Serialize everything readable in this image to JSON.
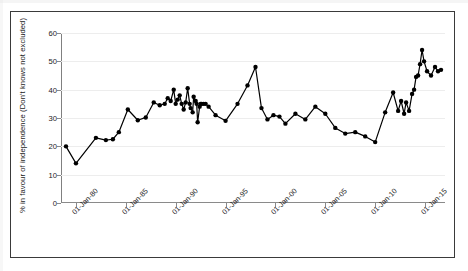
{
  "figure": {
    "background": "#ffffff",
    "frame_color": "#3a3a3a",
    "series_color": "#000000",
    "grid_color": "#ededed"
  },
  "axes": {
    "ylabel": "% in favour of independence (Don't knows not excluded)",
    "xlabel": "",
    "y_ticks": [
      "0",
      "10",
      "20",
      "30",
      "40",
      "50",
      "60"
    ],
    "x_ticks": [
      "01-Jan-80",
      "01-Jan-85",
      "01-Jan-90",
      "01-Jan-95",
      "01-Jan-00",
      "01-Jan-05",
      "01-Jan-10",
      "01-Jan-15"
    ]
  },
  "chart_data": {
    "type": "line",
    "title": "",
    "xlabel": "",
    "ylabel": "% in favour of independence (Don't knows not excluded)",
    "ylim": [
      0,
      60
    ],
    "xlim": [
      1978.5,
      2017.0
    ],
    "grid": true,
    "legend": null,
    "markers": true,
    "marker_shape": "circle",
    "x_tick_labels": [
      "01-Jan-80",
      "01-Jan-85",
      "01-Jan-90",
      "01-Jan-95",
      "01-Jan-00",
      "01-Jan-05",
      "01-Jan-10",
      "01-Jan-15"
    ],
    "x_tick_values": [
      1980,
      1985,
      1990,
      1995,
      2000,
      2005,
      2010,
      2015
    ],
    "y_tick_values": [
      0,
      10,
      20,
      30,
      40,
      50,
      60
    ],
    "series": [
      {
        "name": "% in favour of independence",
        "x": [
          1979.0,
          1980.0,
          1982.0,
          1983.0,
          1983.7,
          1984.3,
          1985.2,
          1986.2,
          1987.0,
          1987.8,
          1988.4,
          1988.9,
          1989.2,
          1989.5,
          1989.8,
          1990.0,
          1990.2,
          1990.4,
          1990.6,
          1990.8,
          1991.0,
          1991.2,
          1991.4,
          1991.5,
          1991.7,
          1991.8,
          1992.0,
          1992.1,
          1992.2,
          1992.4,
          1992.5,
          1992.6,
          1992.8,
          1993.0,
          1993.3,
          1994.0,
          1995.0,
          1996.2,
          1997.2,
          1998.0,
          1998.6,
          1999.2,
          1999.8,
          2000.4,
          2001.0,
          2002.0,
          2003.0,
          2004.0,
          2005.0,
          2006.0,
          2007.0,
          2008.0,
          2009.0,
          2010.0,
          2011.0,
          2011.8,
          2012.3,
          2012.6,
          2012.9,
          2013.1,
          2013.4,
          2013.7,
          2013.9,
          2014.1,
          2014.3,
          2014.5,
          2014.7,
          2014.9,
          2015.2,
          2015.6,
          2016.0,
          2016.3,
          2016.6
        ],
        "y": [
          20.0,
          14.0,
          23.0,
          22.2,
          22.5,
          25.0,
          33.0,
          29.2,
          30.2,
          35.5,
          34.5,
          35.0,
          37.0,
          36.0,
          40.0,
          35.0,
          36.5,
          38.0,
          35.0,
          33.0,
          35.5,
          40.5,
          35.0,
          33.5,
          32.0,
          37.5,
          36.0,
          35.0,
          28.5,
          34.0,
          35.0,
          35.0,
          35.0,
          35.0,
          34.0,
          31.0,
          29.0,
          35.0,
          41.5,
          48.0,
          33.5,
          29.5,
          31.0,
          30.5,
          28.0,
          31.5,
          29.5,
          34.0,
          31.5,
          26.5,
          24.5,
          25.0,
          23.5,
          21.5,
          32.0,
          39.0,
          32.5,
          36.0,
          31.5,
          35.5,
          32.5,
          38.5,
          40.0,
          44.5,
          45.0,
          49.0,
          54.0,
          50.0,
          46.5,
          45.0,
          48.0,
          46.5,
          47.0
        ]
      }
    ]
  }
}
